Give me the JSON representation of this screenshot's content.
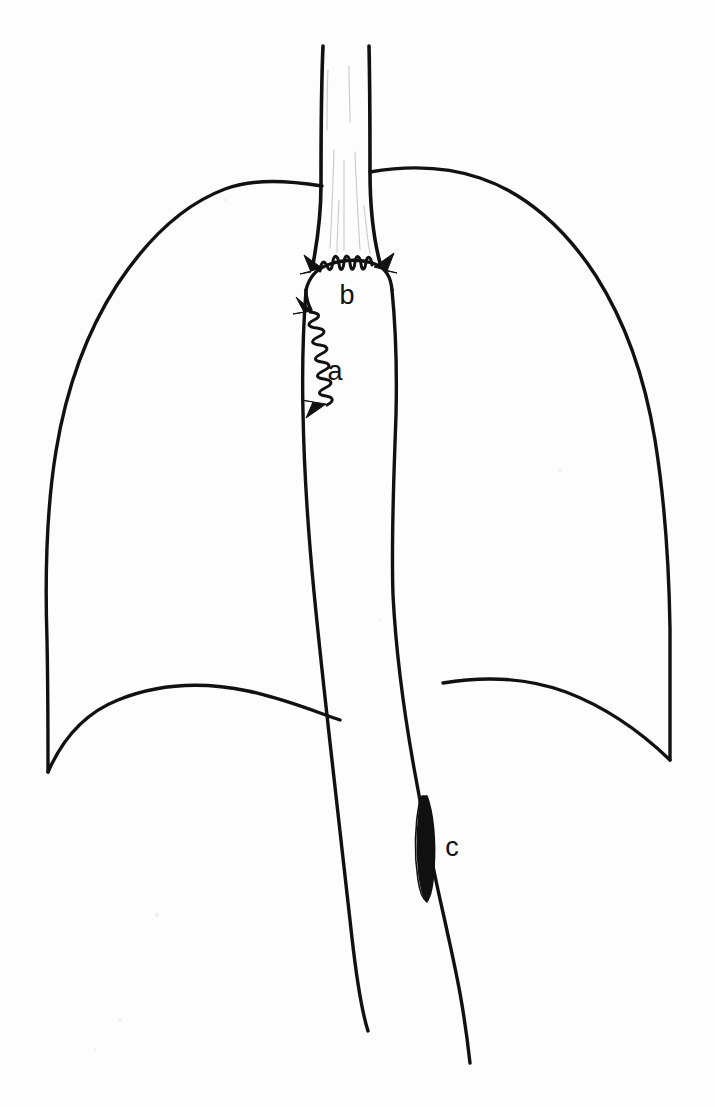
{
  "figure": {
    "background_color": "#fdfdfd",
    "ink_color": "#111111",
    "shading_color": "#c9c9c9",
    "width": 715,
    "height": 1107
  },
  "labels": [
    {
      "id": "a",
      "text": "a",
      "meaning": "longitudinal-suture-line",
      "x": 335,
      "y": 373
    },
    {
      "id": "b",
      "text": "b",
      "meaning": "transverse-anastomosis",
      "x": 347,
      "y": 297
    },
    {
      "id": "c",
      "text": "c",
      "meaning": "fusiform-lesion",
      "x": 452,
      "y": 849
    }
  ],
  "structures": {
    "left_lung": {
      "name": "left-lung-outline",
      "apex_y": 183,
      "costophrenic_angle_x": 48,
      "costophrenic_angle_y": 772
    },
    "right_lung": {
      "name": "right-lung-outline",
      "apex_y": 168,
      "costophrenic_angle_x": 670,
      "costophrenic_angle_y": 760
    },
    "left_diaphragm": {
      "name": "left-hemidiaphragm",
      "dome_y": 688
    },
    "right_diaphragm": {
      "name": "right-hemidiaphragm",
      "dome_y": 683
    },
    "upper_tube": {
      "name": "cervical-conduit-segment",
      "top_y": 45,
      "left_x": 322,
      "right_x": 370
    },
    "conduit": {
      "name": "gastric-conduit",
      "widest_left_x": 302,
      "widest_right_x": 396,
      "bottom_left_y": 1030,
      "bottom_right_y": 1063
    },
    "lesion": {
      "name": "fusiform-lesion",
      "center_x": 428,
      "top_y": 795,
      "bottom_y": 901
    },
    "suture_a": {
      "name": "longitudinal-suture-line",
      "top_y": 305,
      "bottom_y": 414,
      "stitch_count": 11
    },
    "suture_b": {
      "name": "transverse-suture-line",
      "y": 268,
      "left_x": 312,
      "right_x": 382,
      "stitch_count": 6
    }
  }
}
